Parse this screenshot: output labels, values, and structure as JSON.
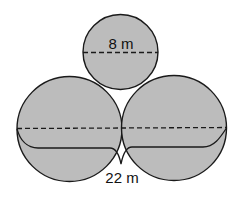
{
  "diagram": {
    "colors": {
      "fill": "#bcbcbc",
      "stroke": "#1a1a1a",
      "background": "#ffffff"
    },
    "top_circle": {
      "label": "8 m",
      "measure": "diameter"
    },
    "bottom_circles": {
      "label": "22 m",
      "measure": "combined width of two bottom circles (brace)"
    }
  }
}
